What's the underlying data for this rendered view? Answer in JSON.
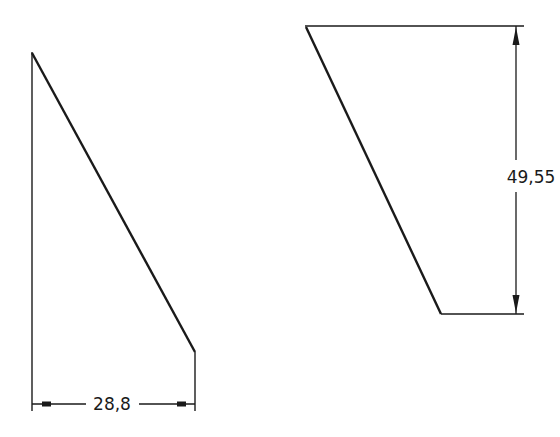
{
  "drawing": {
    "type": "technical-drawing",
    "line_color": "#1a1a1a",
    "background": "#ffffff",
    "figures": [
      {
        "name": "left-triangular-part",
        "dimension": {
          "label": "28,8",
          "orientation": "horizontal"
        }
      },
      {
        "name": "right-trapezoid-part",
        "dimension": {
          "label": "49,55",
          "orientation": "vertical"
        }
      }
    ]
  }
}
